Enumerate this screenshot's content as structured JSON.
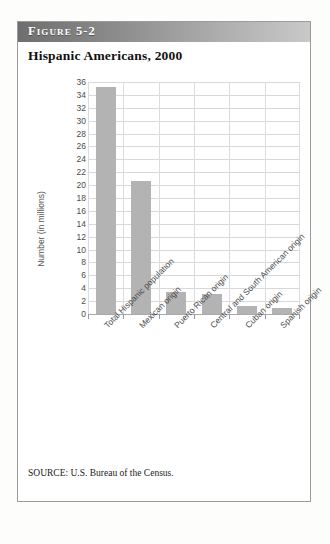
{
  "figure": {
    "header_label": "Figure 5-2",
    "title": "Hispanic Americans, 2000",
    "source": "SOURCE: U.S. Bureau of the Census."
  },
  "colors": {
    "bar": "#b3b3b3",
    "grid": "#d8d8dc",
    "axis": "#a8a8ae",
    "header_dark": "#6e6e6e",
    "header_light": "#c9c9c9",
    "text": "#4c4c4c"
  },
  "chart_data": {
    "type": "bar",
    "title": "Hispanic Americans, 2000",
    "xlabel": "",
    "ylabel": "Number (in millions)",
    "ylim": [
      0,
      36
    ],
    "ytick_step": 2,
    "yticks": [
      36,
      34,
      32,
      30,
      28,
      26,
      24,
      22,
      20,
      18,
      16,
      14,
      12,
      10,
      8,
      6,
      4,
      2,
      0
    ],
    "grid": true,
    "legend": "none",
    "categories": [
      "Total Hispanic population",
      "Mexican origin",
      "Puerto Rican origin",
      "Central and South American origin",
      "Cuban origin",
      "Spanish origin"
    ],
    "values": [
      35.3,
      20.6,
      3.4,
      3.1,
      1.3,
      1.0
    ]
  }
}
